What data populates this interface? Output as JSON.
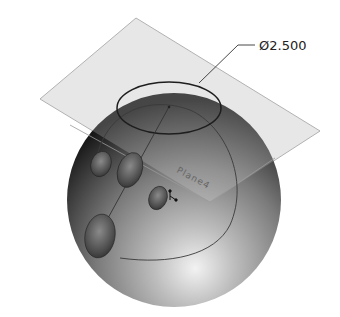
{
  "view": {
    "title": "Bowling ball model with reference plane",
    "dimension": {
      "symbol": "Ø",
      "value": "2.500",
      "label": "Ø2.500",
      "feature": "top-circle-diameter"
    },
    "plane": {
      "label": "Plane4"
    },
    "colors": {
      "plane_fill": "#e9e9e9",
      "plane_edge": "#8a8a8a",
      "sphere_dark": "#1e1e1e",
      "sphere_mid": "#6f6f6f",
      "sphere_highlight": "#eeeeee",
      "sketch_line": "#2a2a2a"
    },
    "holes": [
      {
        "name": "finger-hole-left"
      },
      {
        "name": "finger-hole-middle"
      },
      {
        "name": "finger-hole-right"
      },
      {
        "name": "thumb-hole"
      }
    ]
  }
}
